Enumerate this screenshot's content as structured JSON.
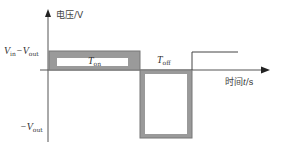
{
  "diagram": {
    "y_axis_label_cn": "电压/V",
    "x_axis_label_cn": "时间",
    "x_axis_var": "t",
    "x_axis_unit": "/s",
    "level_high": {
      "main": "V",
      "sub_in": "in",
      "minus": "−V",
      "sub_out": "out"
    },
    "level_low": {
      "minus": "−V",
      "sub_out": "out"
    },
    "t_on": {
      "main": "T",
      "sub": "on"
    },
    "t_off": {
      "main": "T",
      "sub": "off"
    },
    "colors": {
      "axis": "#555555",
      "pulse_fill": "#9a9a9a",
      "pulse_edge": "#777777",
      "line": "#444444"
    }
  }
}
